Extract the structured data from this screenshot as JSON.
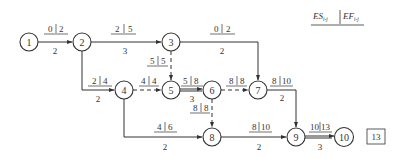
{
  "legend": {
    "es": "ES",
    "ef": "EF",
    "sub": "i-j"
  },
  "project_duration": "13",
  "nodes": [
    {
      "id": "1",
      "x": 29,
      "y": 42
    },
    {
      "id": "2",
      "x": 82,
      "y": 42
    },
    {
      "id": "3",
      "x": 171,
      "y": 42
    },
    {
      "id": "4",
      "x": 124,
      "y": 90
    },
    {
      "id": "5",
      "x": 171,
      "y": 90
    },
    {
      "id": "6",
      "x": 212,
      "y": 90
    },
    {
      "id": "7",
      "x": 258,
      "y": 90
    },
    {
      "id": "8",
      "x": 212,
      "y": 137
    },
    {
      "id": "9",
      "x": 296,
      "y": 137
    },
    {
      "id": "10",
      "x": 344,
      "y": 137
    }
  ],
  "activities": [
    {
      "from": "1",
      "to": "2",
      "es": "0",
      "ef": "2",
      "duration": "2",
      "type": "solid"
    },
    {
      "from": "2",
      "to": "3",
      "es": "2",
      "ef": "5",
      "duration": "3",
      "type": "solid"
    },
    {
      "from": "3",
      "to": "7",
      "es": "0",
      "ef": "2",
      "duration": "2",
      "type": "solid"
    },
    {
      "from": "3",
      "to": "5",
      "es": "5",
      "ef": "5",
      "duration": "",
      "type": "dummy"
    },
    {
      "from": "2",
      "to": "4",
      "es": "2",
      "ef": "4",
      "duration": "2",
      "type": "solid"
    },
    {
      "from": "4",
      "to": "5",
      "es": "4",
      "ef": "4",
      "duration": "",
      "type": "dummy"
    },
    {
      "from": "5",
      "to": "6",
      "es": "5",
      "ef": "8",
      "duration": "3",
      "type": "solid"
    },
    {
      "from": "6",
      "to": "7",
      "es": "8",
      "ef": "8",
      "duration": "",
      "type": "dummy"
    },
    {
      "from": "6",
      "to": "8",
      "es": "8",
      "ef": "8",
      "duration": "",
      "type": "dummy"
    },
    {
      "from": "4",
      "to": "8",
      "es": "4",
      "ef": "6",
      "duration": "2",
      "type": "solid"
    },
    {
      "from": "7",
      "to": "9",
      "es": "8",
      "ef": "10",
      "duration": "2",
      "type": "solid"
    },
    {
      "from": "8",
      "to": "9",
      "es": "8",
      "ef": "10",
      "duration": "2",
      "type": "solid"
    },
    {
      "from": "9",
      "to": "10",
      "es": "10",
      "ef": "13",
      "duration": "3",
      "type": "solid"
    }
  ]
}
